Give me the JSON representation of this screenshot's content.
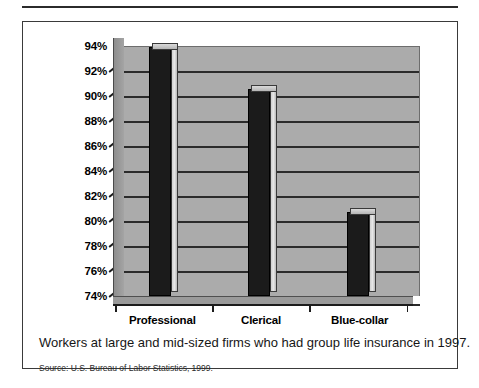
{
  "figure": {
    "caption": "Workers at large and mid-sized firms who had group life insurance in 1997.",
    "source": "Source:  U.S. Bureau of Labor Statistics, 1999."
  },
  "axis": {
    "y_ticks": [
      "94%",
      "92%",
      "90%",
      "88%",
      "86%",
      "84%",
      "82%",
      "80%",
      "78%",
      "76%",
      "74%"
    ]
  },
  "colors": {
    "bar_fill": "#1b1b1b",
    "plot_background": "#ababab",
    "gridline": "#2b2b2b",
    "border": "#3a3a3a",
    "page_background": "#ffffff"
  },
  "chart_data": {
    "type": "bar",
    "title": "",
    "subtitle": "",
    "xlabel": "",
    "ylabel": "",
    "categories": [
      "Professional",
      "Clerical",
      "Blue-collar"
    ],
    "values": [
      93.9,
      90.6,
      80.7
    ],
    "ylim": [
      74,
      94
    ],
    "ytick_values": [
      94,
      92,
      90,
      88,
      86,
      84,
      82,
      80,
      78,
      76,
      74
    ],
    "ytick_labels": [
      "94%",
      "92%",
      "90%",
      "88%",
      "86%",
      "84%",
      "82%",
      "80%",
      "78%",
      "76%",
      "74%"
    ],
    "grid": true,
    "grid_axis": "y",
    "legend": false,
    "legend_position": "none",
    "style": "3d-bar",
    "annotations": [
      "Workers at large and mid-sized firms who had group life insurance in 1997.",
      "Source:  U.S. Bureau of Labor Statistics, 1999."
    ]
  }
}
